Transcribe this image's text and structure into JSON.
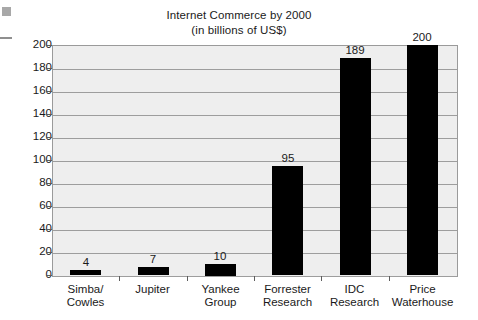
{
  "chart_data": {
    "type": "bar",
    "title": "Internet Commerce by 2000",
    "subtitle": "(in billions of US$)",
    "xlabel": "",
    "ylabel": "",
    "ylim": [
      0,
      200
    ],
    "ytick_step": 20,
    "grid": true,
    "legend": "none",
    "bar_color": "#000000",
    "plot_background": "#eeeeee",
    "categories": [
      "Simba/\nCowles",
      "Jupiter",
      "Yankee Group",
      "Forrester\nResearch",
      "IDC Research",
      "Price\nWaterhouse"
    ],
    "values": [
      4,
      7,
      10,
      95,
      189,
      200
    ],
    "value_labels": [
      "4",
      "7",
      "10",
      "95",
      "189",
      "200"
    ],
    "yticks": [
      0,
      20,
      40,
      60,
      80,
      100,
      120,
      140,
      160,
      180,
      200
    ],
    "ytick_labels": [
      "0",
      "20",
      "40",
      "60",
      "80",
      "100",
      "120",
      "140",
      "160",
      "180",
      "200"
    ]
  },
  "artifacts": {
    "corner_square": "scan-artifact-square",
    "margin_dash": "scan-artifact-dash"
  }
}
